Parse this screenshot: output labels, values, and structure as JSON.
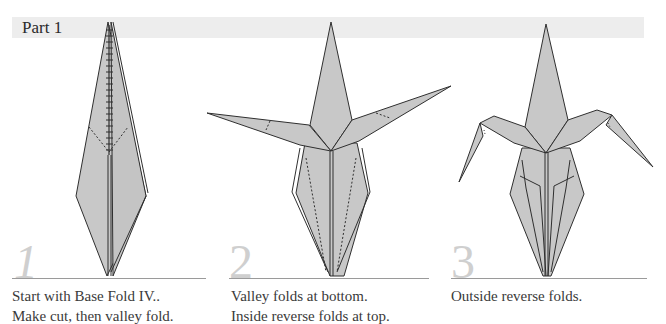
{
  "header": {
    "part_title": "Part 1"
  },
  "steps": [
    {
      "number": "1",
      "caption_lines": [
        "Start with Base Fold IV..",
        "Make cut, then valley fold."
      ]
    },
    {
      "number": "2",
      "caption_lines": [
        "Valley folds at bottom.",
        "Inside reverse folds at top."
      ]
    },
    {
      "number": "3",
      "caption_lines": [
        "Outside reverse folds."
      ]
    }
  ],
  "colors": {
    "paper_fill": "#c8c8c8",
    "outline": "#2f2f2f",
    "header_bar": "#ededed",
    "step_number": "#cfcfcf",
    "rule": "#9a9a9a"
  }
}
